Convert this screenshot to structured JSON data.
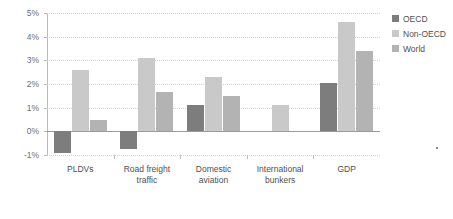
{
  "chart_data": {
    "type": "bar",
    "title": "",
    "subtitle": "",
    "xlabel": "",
    "ylabel": "",
    "ylim": [
      -1,
      5
    ],
    "ytick_values": [
      5,
      4,
      3,
      2,
      1,
      0,
      -1
    ],
    "ytick_labels": [
      "5%",
      "4%",
      "3%",
      "2%",
      "1%",
      "0%",
      "-1%"
    ],
    "grid": true,
    "grid_axis": "y",
    "legend_position": "top-right",
    "categories": [
      "PLDVs",
      "Road freight\ntraffic",
      "Domestic\naviation",
      "International\nbunkers",
      "GDP"
    ],
    "series": [
      {
        "name": "OECD",
        "color": "#7d7d7d",
        "values": [
          -0.9,
          -0.75,
          1.1,
          null,
          2.05
        ]
      },
      {
        "name": "Non-OECD",
        "color": "#c9c9c9",
        "values": [
          2.6,
          3.1,
          2.3,
          1.1,
          4.6
        ]
      },
      {
        "name": "World",
        "color": "#b3b3b3",
        "values": [
          0.5,
          1.65,
          1.5,
          null,
          3.4
        ]
      }
    ]
  },
  "legend": {
    "items": [
      {
        "label": "OECD",
        "color": "#7d7d7d"
      },
      {
        "label": "Non-OECD",
        "color": "#c9c9c9"
      },
      {
        "label": "World",
        "color": "#b3b3b3"
      }
    ]
  },
  "axis": {
    "y_labels": [
      "5%",
      "4%",
      "3%",
      "2%",
      "1%",
      "0%",
      "-1%"
    ],
    "x_labels": [
      "PLDVs",
      "Road freight\ntraffic",
      "Domestic\naviation",
      "International\nbunkers",
      "GDP"
    ]
  }
}
